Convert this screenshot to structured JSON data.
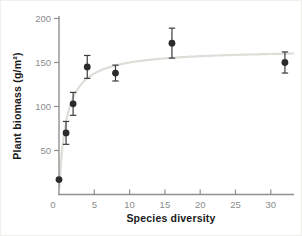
{
  "figure": {
    "background": "#ffffff",
    "frame_color": "#efefec"
  },
  "chart_data": {
    "type": "scatter",
    "title": "",
    "xlabel": "Species diversity",
    "ylabel": "Plant biomass (g/m²)",
    "xlim": [
      0,
      33.3
    ],
    "ylim": [
      0,
      205
    ],
    "x_ticks": [
      0,
      5,
      10,
      15,
      20,
      25,
      30
    ],
    "y_ticks": [
      50,
      100,
      150,
      200
    ],
    "grid": false,
    "legend": false,
    "points": [
      {
        "x": 0,
        "y": 17,
        "err": 0
      },
      {
        "x": 1,
        "y": 70,
        "err": 13
      },
      {
        "x": 2,
        "y": 103,
        "err": 13
      },
      {
        "x": 4,
        "y": 145,
        "err": 13
      },
      {
        "x": 8,
        "y": 138,
        "err": 9
      },
      {
        "x": 16,
        "y": 172,
        "err": 17
      },
      {
        "x": 32,
        "y": 150,
        "err": 12
      }
    ],
    "trend_curve": {
      "model": "y = a*x/(b+x)",
      "a": 165,
      "b": 1.0,
      "x_start": 0.05,
      "x_end": 33.2,
      "color": "#deded9"
    },
    "colors": {
      "point": "#2b2b2b",
      "error_bar": "#3c3c3c",
      "axis": "#909090",
      "tick_label": "#8c8c8c",
      "axis_label": "#1a1a1a"
    }
  }
}
